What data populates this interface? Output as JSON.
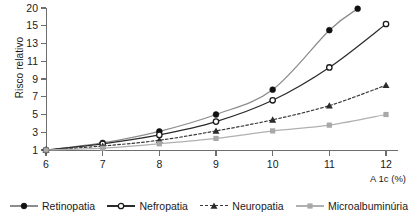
{
  "chart_data": {
    "type": "line",
    "title": "",
    "xlabel": "A 1c (%)",
    "ylabel": "Risco relativo",
    "x": [
      6,
      7,
      8,
      9,
      10,
      11,
      11.5,
      12
    ],
    "xticks": [
      "6",
      "7",
      "8",
      "9",
      "10",
      "11",
      "12"
    ],
    "xtick_values": [
      6,
      7,
      8,
      9,
      10,
      11,
      12
    ],
    "xlim": [
      6,
      12
    ],
    "yticks": [
      "1",
      "3",
      "5",
      "7",
      "9",
      "11",
      "13",
      "15",
      "20"
    ],
    "ytick_values": [
      1,
      3,
      5,
      7,
      9,
      11,
      13,
      15,
      20
    ],
    "ylim": [
      1,
      20
    ],
    "grid": false,
    "legend_position": "bottom",
    "series": [
      {
        "name": "Retinopatia",
        "marker": "filled-circle",
        "linestyle": "solid",
        "color": "#8c8c8c",
        "marker_color": "#111111",
        "x": [
          6,
          7,
          8,
          9,
          10,
          11,
          11.5
        ],
        "values": [
          1,
          1.8,
          3.1,
          5.0,
          7.8,
          14.5,
          19.8
        ]
      },
      {
        "name": "Nefropatia",
        "marker": "open-circle",
        "linestyle": "solid",
        "color": "#2b2b2b",
        "marker_color": "#1a1a1a",
        "x": [
          6,
          7,
          8,
          9,
          10,
          11,
          12
        ],
        "values": [
          1,
          1.7,
          2.7,
          4.2,
          6.6,
          10.3,
          15.5
        ]
      },
      {
        "name": "Neuropatia",
        "marker": "filled-triangle",
        "linestyle": "dashed",
        "color": "#3a3a3a",
        "marker_color": "#2b2b2b",
        "x": [
          6,
          7,
          8,
          9,
          10,
          11,
          12
        ],
        "values": [
          1,
          1.45,
          2.1,
          3.15,
          4.4,
          6.0,
          8.3
        ]
      },
      {
        "name": "Microalbuminúria",
        "marker": "filled-square",
        "linestyle": "solid",
        "color": "#b0b0b0",
        "marker_color": "#a8a8a8",
        "x": [
          6,
          7,
          8,
          9,
          10,
          11,
          12
        ],
        "values": [
          1,
          1.2,
          1.7,
          2.3,
          3.15,
          3.8,
          5.0
        ]
      }
    ]
  },
  "legend": {
    "items": [
      {
        "label": "Retinopatia"
      },
      {
        "label": "Nefropatia"
      },
      {
        "label": "Neuropatia"
      },
      {
        "label": "Microalbuminúria"
      }
    ]
  }
}
